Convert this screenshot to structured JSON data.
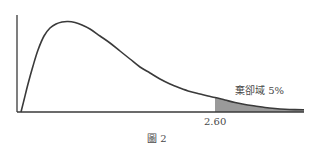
{
  "chart_data": {
    "type": "area",
    "title": "",
    "caption": "圖 2",
    "xlabel": "",
    "ylabel": "",
    "grid": false,
    "legend": null,
    "x_ticks": [
      "2.60"
    ],
    "critical_value": 2.6,
    "shaded_region": {
      "from": 2.6,
      "to": "tail",
      "label": "棄卻域 5%",
      "area_percent": 5
    },
    "curve_points_px": [
      [
        21,
        112
      ],
      [
        24,
        100
      ],
      [
        28,
        84
      ],
      [
        33,
        66
      ],
      [
        38,
        50
      ],
      [
        44,
        36
      ],
      [
        50,
        28
      ],
      [
        56,
        24
      ],
      [
        62,
        22
      ],
      [
        68,
        21.5
      ],
      [
        75,
        22.5
      ],
      [
        82,
        25
      ],
      [
        90,
        29
      ],
      [
        100,
        36
      ],
      [
        110,
        43
      ],
      [
        120,
        51
      ],
      [
        130,
        59
      ],
      [
        140,
        67
      ],
      [
        150,
        73
      ],
      [
        160,
        79
      ],
      [
        170,
        84
      ],
      [
        180,
        88
      ],
      [
        190,
        91.5
      ],
      [
        200,
        94
      ],
      [
        208,
        96
      ],
      [
        215,
        97.5
      ],
      [
        225,
        100
      ],
      [
        235,
        102.5
      ],
      [
        245,
        104.5
      ],
      [
        255,
        106
      ],
      [
        265,
        107.5
      ],
      [
        275,
        108.5
      ],
      [
        285,
        109.2
      ],
      [
        295,
        109.6
      ],
      [
        304,
        109.8
      ]
    ],
    "axis_px": {
      "x_start": 17,
      "x_end": 304,
      "y_axis_top": 15,
      "baseline_y": 112
    },
    "critical_x_px": 215,
    "colors": {
      "line": "#3a3a3a",
      "shade": "#9a9a9a",
      "text": "#4a4a4a"
    }
  },
  "labels": {
    "region": "棄卻域 5%",
    "tick": "2.60",
    "caption": "圖 2"
  }
}
